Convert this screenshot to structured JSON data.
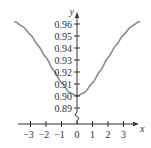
{
  "chart_data": {
    "type": "line",
    "title": "",
    "xlabel": "x",
    "ylabel": "y",
    "xlim": [
      -3.8,
      3.8
    ],
    "ylim": [
      0.885,
      0.965
    ],
    "x_ticks": [
      -3,
      -2,
      -1,
      0,
      1,
      2,
      3
    ],
    "x_tick_labels": [
      "−3",
      "−2",
      "−1",
      "0",
      "1",
      "2",
      "3"
    ],
    "y_ticks": [
      0.89,
      0.9,
      0.91,
      0.92,
      0.93,
      0.94,
      0.95,
      0.96
    ],
    "y_tick_labels": [
      "0.89",
      "0.90",
      "0.91",
      "0.92",
      "0.93",
      "0.94",
      "0.95",
      "0.96"
    ],
    "grid": false,
    "legend": null,
    "y_axis_break": true,
    "series": [
      {
        "name": "curve",
        "color": "#8a8a8a",
        "x": [
          -4,
          -3.5,
          -3,
          -2.5,
          -2,
          -1.5,
          -1,
          -0.5,
          0,
          0.5,
          1,
          1.5,
          2,
          2.5,
          3,
          3.5,
          4
        ],
        "y": [
          0.962,
          0.958,
          0.951,
          0.942,
          0.932,
          0.921,
          0.911,
          0.903,
          0.9,
          0.903,
          0.911,
          0.921,
          0.932,
          0.942,
          0.951,
          0.958,
          0.962
        ]
      }
    ]
  }
}
